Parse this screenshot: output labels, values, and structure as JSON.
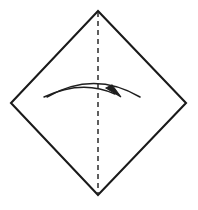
{
  "figure": {
    "domain": "Diagram",
    "kind": "origami-fold-step",
    "title": "Origami step: fold square diagonally in half",
    "caption": "",
    "width": 198,
    "height": 210,
    "background_color": "#ffffff"
  },
  "colors": {
    "outline": "#1a1a1a",
    "crease": "#2b2b2b",
    "arrow": "#1f1f1f",
    "paper_fill": "#ffffff",
    "background": "#ffffff"
  },
  "shapes": {
    "paper": {
      "name": "square-rotated-45",
      "label": "paper-outline",
      "stroke_width": 2.1,
      "fill": "#ffffff",
      "vertices": [
        {
          "name": "top",
          "x": 98,
          "y": 11
        },
        {
          "name": "right",
          "x": 186,
          "y": 103
        },
        {
          "name": "bottom",
          "x": 98,
          "y": 195
        },
        {
          "name": "left",
          "x": 11,
          "y": 103
        }
      ],
      "points_attr": "98,11 186,103 98,195 11,103"
    },
    "crease": {
      "name": "vertical-crease-line",
      "label": "valley-fold-line",
      "style": "dashed",
      "stroke_width": 1.5,
      "dash_pattern": "5 4",
      "x1": 98,
      "y1": 12,
      "x2": 98,
      "y2": 194
    },
    "arrow": {
      "name": "fold-arrow",
      "label": "fold-direction-arrow",
      "direction": "right",
      "stroke_width": 1.5,
      "upper_arc_path": "M 47,97 Q 94,70 140,97",
      "lower_arc_path": "M 44,97 Q 82,79 115,94",
      "head_points": "121,97 106,88 112,85"
    }
  },
  "annotations": {
    "step_number": "",
    "instruction": ""
  }
}
